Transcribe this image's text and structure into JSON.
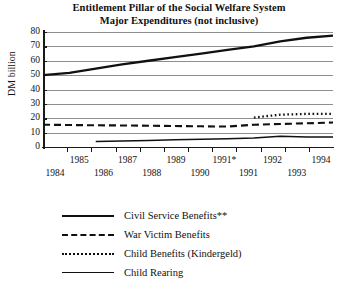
{
  "chart_data": {
    "type": "line",
    "title": "Entitlement Pillar of the Social Welfare System",
    "subtitle": "Major Expenditures (not inclusive)",
    "xlabel": "",
    "ylabel": "DM billion",
    "ylim": [
      0,
      80
    ],
    "ytick_values": [
      80,
      70,
      60,
      50,
      40,
      30,
      20,
      10,
      0
    ],
    "grid": true,
    "legend_position": "bottom-left",
    "x_axis_style": "staggered two rows",
    "x_tick_labels_top": [
      "1985",
      "1987",
      "1989",
      "1991*",
      "1992",
      "1994"
    ],
    "x_tick_labels_bottom": [
      "1984",
      "1986",
      "1988",
      "1990",
      "1991",
      "1993"
    ],
    "categories": [
      "1984",
      "1985",
      "1986",
      "1987",
      "1988",
      "1989",
      "1990",
      "1991",
      "1991*",
      "1992",
      "1993",
      "1994"
    ],
    "series": [
      {
        "name": "Civil Service Benefits**",
        "style": "solid-thick",
        "values": [
          50,
          51.5,
          54.5,
          57.5,
          60,
          62.5,
          65,
          67.5,
          70,
          73.5,
          76,
          77.5
        ]
      },
      {
        "name": "War Victim Benefits",
        "style": "dashed",
        "values": [
          15.5,
          15.3,
          15.1,
          15,
          14.8,
          14.6,
          14.4,
          14.2,
          15.5,
          16,
          16.5,
          17
        ]
      },
      {
        "name": "Child Benefits (Kindergeld)",
        "style": "dotted",
        "values": [
          null,
          null,
          null,
          null,
          null,
          null,
          null,
          null,
          20.5,
          22.5,
          23,
          23
        ]
      },
      {
        "name": "Child Rearing",
        "style": "solid-thin",
        "values": [
          null,
          null,
          3.8,
          4.2,
          4.6,
          5,
          5.4,
          5.8,
          6.2,
          7.5,
          7,
          7
        ]
      }
    ]
  },
  "chart": {
    "title_line1": "Entitlement Pillar of the Social Welfare System",
    "title_line2": "Major Expenditures (not inclusive)",
    "y_axis_title": "DM billion",
    "y_ticks": [
      "80",
      "70",
      "60",
      "50",
      "40",
      "30",
      "20",
      "10",
      "0"
    ],
    "x_labels_top": [
      "1985",
      "1987",
      "1989",
      "1991*",
      "1992",
      "1994"
    ],
    "x_labels_bottom": [
      "1984",
      "1986",
      "1988",
      "1990",
      "1991",
      "1993"
    ]
  },
  "legend": {
    "items": [
      {
        "label": "Civil Service Benefits**",
        "style": "solid-thick"
      },
      {
        "label": "War Victim Benefits",
        "style": "dashed"
      },
      {
        "label": "Child Benefits (Kindergeld)",
        "style": "dotted"
      },
      {
        "label": "Child Rearing",
        "style": "solid-thin"
      }
    ]
  },
  "colors": {
    "ink": "#111111",
    "grid": "#8e8e8e",
    "background": "#ffffff"
  }
}
